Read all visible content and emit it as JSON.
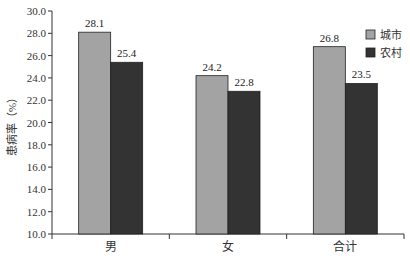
{
  "chart_data": {
    "type": "bar",
    "title": "",
    "xlabel": "",
    "ylabel": "患病率（%）",
    "ylim": [
      10.0,
      30.0
    ],
    "yticks": [
      "10.0",
      "12.0",
      "14.0",
      "16.0",
      "18.0",
      "20.0",
      "22.0",
      "24.0",
      "26.0",
      "28.0",
      "30.0"
    ],
    "categories": [
      "男",
      "女",
      "合计"
    ],
    "series": [
      {
        "name": "城市",
        "color": "#a3a3a3",
        "values": [
          28.1,
          24.2,
          26.8
        ]
      },
      {
        "name": "农村",
        "color": "#333333",
        "values": [
          25.4,
          22.8,
          23.5
        ]
      }
    ],
    "value_labels": [
      [
        "28.1",
        "24.2",
        "26.8"
      ],
      [
        "25.4",
        "22.8",
        "23.5"
      ]
    ],
    "grid": false,
    "legend_position": "top-right"
  }
}
